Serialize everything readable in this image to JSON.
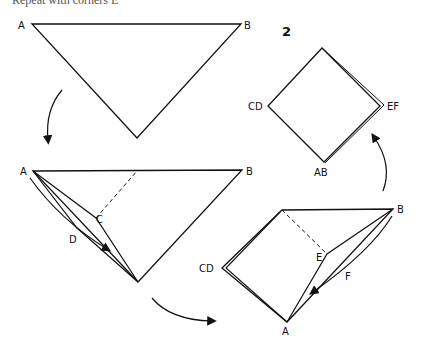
{
  "caption_partial": "Repeat with corners E",
  "step_number": "2",
  "labels": {
    "fig1": {
      "a": "A",
      "b": "B"
    },
    "fig2": {
      "a": "A",
      "b": "B",
      "c": "C",
      "d": "D"
    },
    "fig3": {
      "cd": "CD",
      "b": "B",
      "e": "E",
      "f": "F",
      "a": "A"
    },
    "fig4": {
      "cd": "CD",
      "ef": "EF",
      "ab": "AB"
    }
  },
  "colors": {
    "ink": "#111111",
    "background": "#ffffff"
  }
}
